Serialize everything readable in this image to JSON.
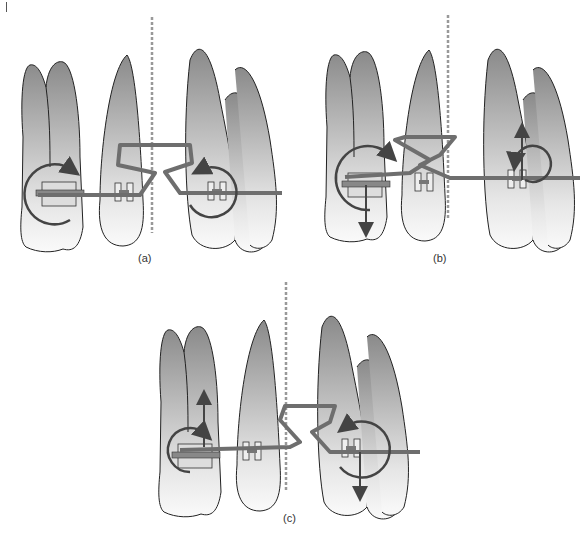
{
  "figure": {
    "panels": [
      {
        "id": "a",
        "label": "(a)"
      },
      {
        "id": "b",
        "label": "(b)"
      },
      {
        "id": "c",
        "label": "(c)"
      }
    ],
    "colors": {
      "tooth_fill_dark": "#8a8a8a",
      "tooth_fill_light": "#f2f2f2",
      "wire": "#6e6e6e",
      "arrow": "#444444",
      "midline": "#999999",
      "outline": "#222222"
    }
  }
}
